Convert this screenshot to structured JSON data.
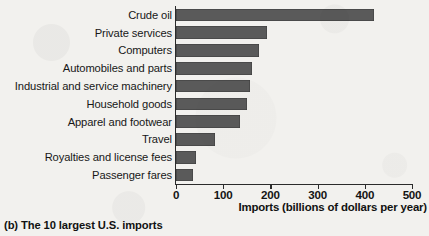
{
  "chart_data": {
    "type": "bar",
    "orientation": "horizontal",
    "title": "",
    "subtitle": "",
    "caption": "(b) The 10 largest U.S. imports",
    "xlabel": "Imports (billions of dollars per year)",
    "ylabel": "",
    "xlim": [
      0,
      500
    ],
    "xticks": [
      0,
      100,
      200,
      300,
      400,
      500
    ],
    "xtick_labels": [
      "0",
      "100",
      "200",
      "300",
      "400",
      "500"
    ],
    "grid": false,
    "legend": null,
    "bar_color": "#5a5a5a",
    "axis_color": "#2b2b2b",
    "background_color": "#f2f1ee",
    "categories": [
      "Crude oil",
      "Private services",
      "Computers",
      "Automobiles and parts",
      "Industrial and service machinery",
      "Household goods",
      "Apparel and footwear",
      "Travel",
      "Royalties and license fees",
      "Passenger fares"
    ],
    "values": [
      420,
      192,
      176,
      160,
      157,
      150,
      135,
      83,
      43,
      36
    ],
    "units": "billions of dollars per year"
  }
}
